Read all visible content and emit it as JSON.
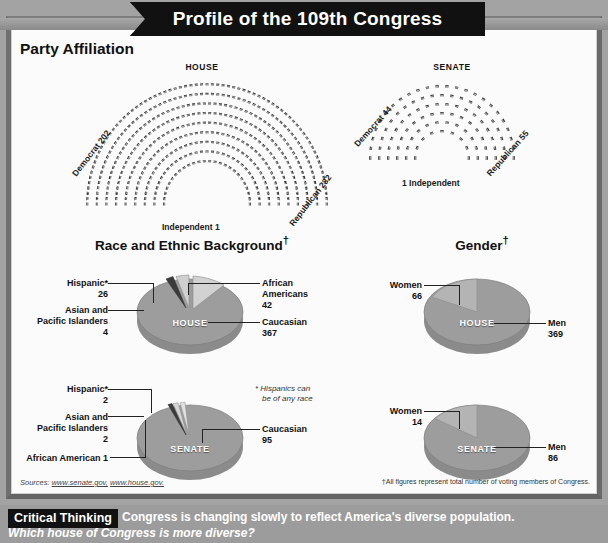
{
  "banner": {
    "title": "Profile of the 109th Congress"
  },
  "sections": {
    "party": {
      "heading": "Party Affiliation",
      "house": {
        "caption": "HOUSE",
        "democrat": "Democrat 202",
        "republican": "Republican 232",
        "independent": "Independent 1",
        "democrat_value": 202,
        "republican_value": 232,
        "independent_value": 1
      },
      "senate": {
        "caption": "SENATE",
        "democrat": "Democrat 44",
        "republican": "Republican 55",
        "independent": "1 Independent",
        "democrat_value": 44,
        "republican_value": 55,
        "independent_value": 1
      }
    },
    "race": {
      "heading": "Race and Ethnic Background",
      "dagger": "†",
      "note": "* Hispanics can\nbe of any race",
      "note_line1": "* Hispanics can",
      "note_line2": "be of any race",
      "house": {
        "chamber": "HOUSE",
        "labels": {
          "hispanic_name": "Hispanic*",
          "hispanic_value": "26",
          "asian_name_1": "Asian and",
          "asian_name_2": "Pacific Islanders",
          "asian_value": "4",
          "african_name_1": "African",
          "african_name_2": "Americans",
          "african_value": "42",
          "caucasian_name": "Caucasian",
          "caucasian_value": "367"
        }
      },
      "senate": {
        "chamber": "SENATE",
        "labels": {
          "hispanic_name": "Hispanic*",
          "hispanic_value": "2",
          "asian_name_1": "Asian and",
          "asian_name_2": "Pacific Islanders",
          "asian_value": "2",
          "african_name": "African American 1",
          "caucasian_name": "Caucasian",
          "caucasian_value": "95"
        }
      }
    },
    "gender": {
      "heading": "Gender",
      "dagger": "†",
      "house": {
        "chamber": "HOUSE",
        "women_name": "Women",
        "women_value": "66",
        "men_name": "Men",
        "men_value": "369"
      },
      "senate": {
        "chamber": "SENATE",
        "women_name": "Women",
        "women_value": "14",
        "men_name": "Men",
        "men_value": "86"
      }
    }
  },
  "footer": {
    "sources_label": "Sources:",
    "source_1": "www.senate.gov,",
    "source_2": "www.house.gov.",
    "footnote": "†All figures represent total number of voting members of Congress."
  },
  "critical_thinking": {
    "badge": "Critical Thinking",
    "statement": "Congress is changing slowly to reflect America's diverse population.",
    "question": "Which house of Congress is more diverse?"
  },
  "chart_data": [
    {
      "type": "bar",
      "title": "House Party Affiliation (seating chart)",
      "categories": [
        "Democrat",
        "Republican",
        "Independent"
      ],
      "values": [
        202,
        232,
        1
      ],
      "xlabel": "Party",
      "ylabel": "Seats",
      "ylim": [
        0,
        240
      ]
    },
    {
      "type": "bar",
      "title": "Senate Party Affiliation (seating chart)",
      "categories": [
        "Democrat",
        "Republican",
        "Independent"
      ],
      "values": [
        44,
        55,
        1
      ],
      "xlabel": "Party",
      "ylabel": "Seats",
      "ylim": [
        0,
        60
      ]
    },
    {
      "type": "pie",
      "title": "House Race and Ethnic Background",
      "categories": [
        "Caucasian",
        "African Americans",
        "Hispanic",
        "Asian and Pacific Islanders"
      ],
      "values": [
        367,
        42,
        26,
        4
      ],
      "legend": "labeled callouts"
    },
    {
      "type": "pie",
      "title": "Senate Race and Ethnic Background",
      "categories": [
        "Caucasian",
        "Hispanic",
        "Asian and Pacific Islanders",
        "African American"
      ],
      "values": [
        95,
        2,
        2,
        1
      ],
      "legend": "labeled callouts"
    },
    {
      "type": "pie",
      "title": "House Gender",
      "categories": [
        "Men",
        "Women"
      ],
      "values": [
        369,
        66
      ],
      "legend": "labeled callouts"
    },
    {
      "type": "pie",
      "title": "Senate Gender",
      "categories": [
        "Men",
        "Women"
      ],
      "values": [
        86,
        14
      ],
      "legend": "labeled callouts"
    }
  ],
  "colors": {
    "banner_bg": "#111111",
    "pie_major": "#9a9a9a",
    "pie_minor": "#c8c8c8",
    "pie_side": "#8f8f8f",
    "frame": "#8d8d8d",
    "paper": "#fbfbfb"
  }
}
